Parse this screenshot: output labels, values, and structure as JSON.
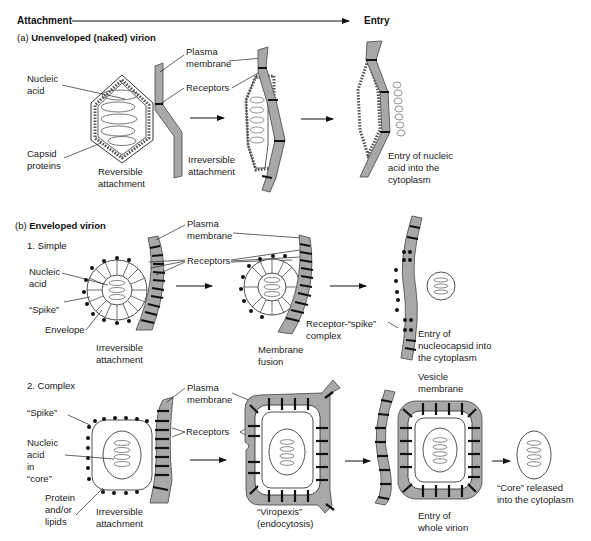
{
  "header": {
    "left_label": "Attachment",
    "right_label": "Entry"
  },
  "section_a": {
    "prefix": "(a) ",
    "title": "Unenveloped (naked) virion",
    "labels": {
      "nucleic_acid": "Nucleic\nacid",
      "capsid_proteins": "Capsid\nproteins",
      "plasma_membrane": "Plasma\nmembrane",
      "receptors": "Receptors",
      "reversible_attachment": "Reversible\nattachment",
      "irreversible_attachment": "Irreversible\nattachment",
      "entry": "Entry of nucleic\nacid into the\ncytoplasm"
    }
  },
  "section_b": {
    "prefix": "(b) ",
    "title": "Enveloped virion",
    "simple": {
      "title": "1. Simple",
      "labels": {
        "nucleic_acid": "Nucleic\nacid",
        "spike": "“Spike”",
        "envelope": "Envelope",
        "plasma_membrane": "Plasma\nmembrane",
        "receptors": "Receptors",
        "irreversible_attachment": "Irreversible\nattachment",
        "membrane_fusion": "Membrane\nfusion",
        "receptor_spike_complex": "Receptor-“spike”\ncomplex",
        "entry": "Entry of\nnucleocapsid into\nthe cytoplasm"
      }
    },
    "complex": {
      "title": "2. Complex",
      "labels": {
        "spike": "“Spike”",
        "nucleic_acid_core": "Nucleic\nacid\nin\n“core”",
        "protein_lipids": "Protein\nand/or\nlipids",
        "plasma_membrane": "Plasma\nmembrane",
        "receptors": "Receptors",
        "irreversible_attachment": "Irreversible\nattachment",
        "viropexis": "“Viropexis”\n(endocytosis)",
        "vesicle_membrane": "Vesicle\nmembrane",
        "entry_whole": "Entry of\nwhole virion",
        "core_released": "“Core” released\ninto the cytoplasm"
      }
    }
  },
  "colors": {
    "membrane_fill": "#a8a8a8",
    "stroke": "#1a1a1a",
    "background": "#ffffff"
  }
}
